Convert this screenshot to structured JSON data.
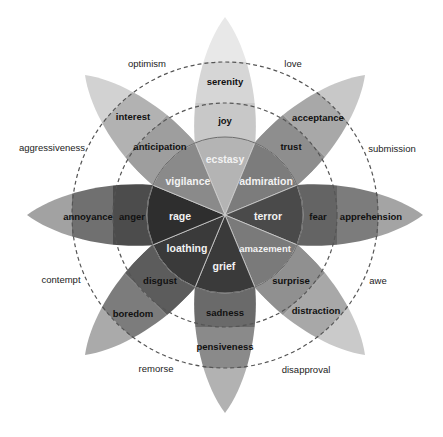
{
  "petals": [
    {
      "id": "joy",
      "angle": -90,
      "inner": "ecstasy",
      "primary": "joy",
      "outer": "serenity",
      "shades": [
        "#b4b4b4",
        "#c8c8c8",
        "#d6d6d6",
        "#e8e8e8"
      ]
    },
    {
      "id": "trust",
      "angle": -45,
      "inner": "admiration",
      "primary": "trust",
      "outer": "acceptance",
      "shades": [
        "#7c7c7c",
        "#8e8e8e",
        "#a8a8a8",
        "#c8c8c8"
      ]
    },
    {
      "id": "fear",
      "angle": 0,
      "inner": "terror",
      "primary": "fear",
      "outer": "apprehension",
      "shades": [
        "#4a4a4a",
        "#646464",
        "#7c7c7c",
        "#a4a4a4"
      ]
    },
    {
      "id": "surprise",
      "angle": 45,
      "inner": "amazement",
      "primary": "surprise",
      "outer": "distraction",
      "shades": [
        "#7a7a7a",
        "#909090",
        "#a8a8a8",
        "#cacaca"
      ]
    },
    {
      "id": "sadness",
      "angle": 90,
      "inner": "grief",
      "primary": "sadness",
      "outer": "pensiveness",
      "shades": [
        "#3a3a3a",
        "#6a6a6a",
        "#8a8a8a",
        "#b2b2b2"
      ]
    },
    {
      "id": "disgust",
      "angle": 135,
      "inner": "loathing",
      "primary": "disgust",
      "outer": "boredom",
      "shades": [
        "#3a3a3a",
        "#5c5c5c",
        "#7c7c7c",
        "#aaaaaa"
      ]
    },
    {
      "id": "anger",
      "angle": 180,
      "inner": "rage",
      "primary": "anger",
      "outer": "annoyance",
      "shades": [
        "#2e2e2e",
        "#4c4c4c",
        "#707070",
        "#a2a2a2"
      ]
    },
    {
      "id": "anticipation",
      "angle": -135,
      "inner": "vigilance",
      "primary": "anticipation",
      "outer": "interest",
      "shades": [
        "#8a8a8a",
        "#9e9e9e",
        "#b2b2b2",
        "#d2d2d2"
      ]
    }
  ],
  "labels": {
    "inner": {
      "ecstasy": "ecstasy",
      "admiration": "admiration",
      "terror": "terror",
      "amazement": "amazement",
      "grief": "grief",
      "loathing": "loathing",
      "rage": "rage",
      "vigilance": "vigilance"
    },
    "primary": {
      "joy": "joy",
      "trust": "trust",
      "fear": "fear",
      "surprise": "surprise",
      "sadness": "sadness",
      "disgust": "disgust",
      "anger": "anger",
      "anticipation": "anticipation"
    },
    "outer": {
      "serenity": "serenity",
      "acceptance": "acceptance",
      "apprehension": "apprehension",
      "distraction": "distraction",
      "pensiveness": "pensiveness",
      "boredom": "boredom",
      "annoyance": "annoyance",
      "interest": "interest"
    },
    "dyads": {
      "love": "love",
      "submission": "submission",
      "awe": "awe",
      "disapproval": "disapproval",
      "remorse": "remorse",
      "contempt": "contempt",
      "aggressiveness": "aggressiveness",
      "optimism": "optimism"
    }
  },
  "geometry": {
    "center": [
      225,
      215
    ],
    "inner_circle_radius": 78,
    "dashed_ring_radii": [
      112,
      153
    ],
    "petal_length": 198
  }
}
